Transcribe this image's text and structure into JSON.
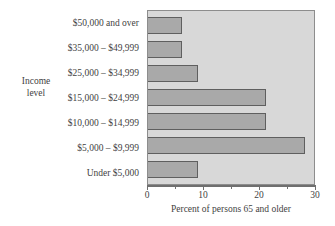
{
  "chart_data": {
    "type": "bar",
    "orientation": "horizontal",
    "title": "",
    "xlabel": "Percent of persons 65 and older",
    "ylabel": "Income level",
    "xlim": [
      0,
      30
    ],
    "grid": false,
    "legend": null,
    "categories": [
      "$50,000 and over",
      "$35,000 – $49,999",
      "$25,000 – $34,999",
      "$15,000 – $24,999",
      "$10,000 – $14,999",
      "$5,000 – $9,999",
      "Under $5,000"
    ],
    "values": [
      6,
      6,
      9,
      21,
      21,
      28,
      9
    ],
    "xticks": [
      0,
      5,
      10,
      15,
      20,
      25,
      30
    ],
    "xtick_labels": [
      "0",
      "",
      "10",
      "",
      "20",
      "",
      "30"
    ],
    "colors": {
      "bar_fill": "#a9a9a9",
      "bar_edge": "#5f5f5f",
      "panel_background": "#d8d8d8",
      "panel_border": "#8d8d8d",
      "text": "#3f3f3f",
      "axis": "#6f6f6f"
    }
  },
  "y_axis_title_lines": [
    "Income",
    "level"
  ]
}
